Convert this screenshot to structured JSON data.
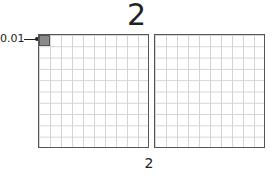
{
  "title": "2",
  "caption": "2",
  "annotation": {
    "label": "0.01",
    "pointer": "arrow-to-shaded-square"
  },
  "grids": [
    {
      "rows": 10,
      "cols": 10,
      "shaded_cells": 1
    },
    {
      "rows": 10,
      "cols": 10,
      "shaded_cells": 0
    }
  ],
  "colors": {
    "shade": "#8a8a8a",
    "border": "#555555",
    "gridline": "#d4d4d4"
  }
}
